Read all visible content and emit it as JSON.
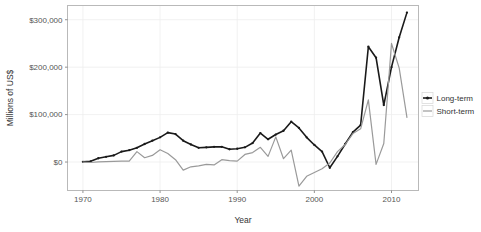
{
  "chart_data": {
    "type": "line",
    "title": "",
    "xlabel": "Year",
    "ylabel": "Millions of US$",
    "xlim": [
      1968,
      2013.5
    ],
    "ylim": [
      -60000,
      330000
    ],
    "xticks": [
      1970,
      1980,
      1990,
      2000,
      2010
    ],
    "xtick_labels": [
      "1970",
      "1980",
      "1990",
      "2000",
      "2010"
    ],
    "yticks": [
      0,
      100000,
      200000,
      300000
    ],
    "ytick_labels": [
      "$0",
      "$100,000",
      "$200,000",
      "$300,000"
    ],
    "grid": true,
    "legend_position": "right",
    "x": [
      1970,
      1971,
      1972,
      1973,
      1974,
      1975,
      1976,
      1977,
      1978,
      1979,
      1980,
      1981,
      1982,
      1983,
      1984,
      1985,
      1986,
      1987,
      1988,
      1989,
      1990,
      1991,
      1992,
      1993,
      1994,
      1995,
      1996,
      1997,
      1998,
      1999,
      2000,
      2001,
      2002,
      2003,
      2004,
      2005,
      2006,
      2007,
      2008,
      2009,
      2010,
      2011,
      2012
    ],
    "series": [
      {
        "name": "Long-term",
        "color": "#1a1a1a",
        "values": [
          500,
          1500,
          8000,
          11000,
          14000,
          22000,
          25000,
          30000,
          38000,
          45000,
          52000,
          62000,
          59000,
          45000,
          37000,
          30000,
          31000,
          32000,
          32000,
          27000,
          28000,
          31000,
          40000,
          61000,
          48000,
          58000,
          66000,
          85000,
          72000,
          52000,
          36000,
          22000,
          -12000,
          12000,
          38000,
          63000,
          78000,
          243000,
          220000,
          120000,
          200000,
          263000,
          315000
        ]
      },
      {
        "name": "Short-term",
        "color": "#9a9a9a",
        "values": [
          0,
          -1000,
          500,
          1000,
          1500,
          1800,
          2000,
          22000,
          9000,
          14000,
          26000,
          18000,
          5000,
          -17000,
          -10000,
          -8000,
          -5000,
          -6000,
          5000,
          3000,
          2000,
          16000,
          20000,
          31000,
          12000,
          53000,
          7000,
          25000,
          -51000,
          -30000,
          -22000,
          -14000,
          -2000,
          22000,
          37000,
          60000,
          70000,
          131000,
          -5000,
          39000,
          250000,
          198000,
          94000
        ]
      }
    ]
  },
  "legend": {
    "items": [
      {
        "label": "Long-term",
        "color": "#1a1a1a",
        "marker": "point-line"
      },
      {
        "label": "Short-term",
        "color": "#9a9a9a",
        "marker": "line"
      }
    ]
  },
  "axes": {
    "x_title": "Year",
    "y_title": "Millions of US$"
  }
}
